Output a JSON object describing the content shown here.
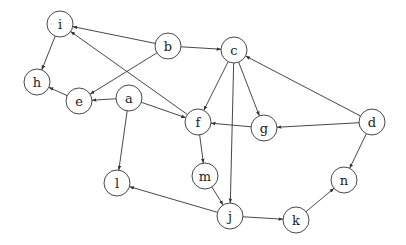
{
  "diagram": {
    "type": "directed-graph",
    "node_radius": 13,
    "colors": {
      "stroke": "#333333",
      "fill": "#ffffff",
      "text": "#222222"
    },
    "nodes": [
      {
        "id": "i",
        "label": "i",
        "x": 60,
        "y": 24
      },
      {
        "id": "b",
        "label": "b",
        "x": 168,
        "y": 46
      },
      {
        "id": "c",
        "label": "c",
        "x": 234,
        "y": 50
      },
      {
        "id": "h",
        "label": "h",
        "x": 37,
        "y": 82
      },
      {
        "id": "e",
        "label": "e",
        "x": 79,
        "y": 101
      },
      {
        "id": "a",
        "label": "a",
        "x": 129,
        "y": 98
      },
      {
        "id": "f",
        "label": "f",
        "x": 198,
        "y": 122
      },
      {
        "id": "g",
        "label": "g",
        "x": 264,
        "y": 128
      },
      {
        "id": "d",
        "label": "d",
        "x": 372,
        "y": 122
      },
      {
        "id": "l",
        "label": "l",
        "x": 117,
        "y": 183
      },
      {
        "id": "m",
        "label": "m",
        "x": 205,
        "y": 176
      },
      {
        "id": "n",
        "label": "n",
        "x": 344,
        "y": 180
      },
      {
        "id": "j",
        "label": "j",
        "x": 230,
        "y": 216
      },
      {
        "id": "k",
        "label": "k",
        "x": 296,
        "y": 220
      }
    ],
    "edges": [
      {
        "from": "b",
        "to": "i"
      },
      {
        "from": "f",
        "to": "i"
      },
      {
        "from": "i",
        "to": "h"
      },
      {
        "from": "e",
        "to": "h"
      },
      {
        "from": "b",
        "to": "e"
      },
      {
        "from": "a",
        "to": "e"
      },
      {
        "from": "a",
        "to": "f"
      },
      {
        "from": "a",
        "to": "l"
      },
      {
        "from": "b",
        "to": "c"
      },
      {
        "from": "c",
        "to": "f"
      },
      {
        "from": "c",
        "to": "g"
      },
      {
        "from": "c",
        "to": "j"
      },
      {
        "from": "d",
        "to": "c"
      },
      {
        "from": "d",
        "to": "g"
      },
      {
        "from": "g",
        "to": "f"
      },
      {
        "from": "d",
        "to": "n"
      },
      {
        "from": "f",
        "to": "m"
      },
      {
        "from": "m",
        "to": "j"
      },
      {
        "from": "j",
        "to": "l"
      },
      {
        "from": "j",
        "to": "k"
      },
      {
        "from": "k",
        "to": "n"
      }
    ]
  }
}
